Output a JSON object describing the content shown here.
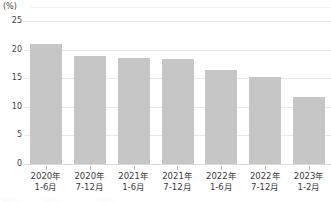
{
  "chart_data": {
    "type": "bar",
    "title": "",
    "subtitle": "",
    "xlabel": "",
    "ylabel": "(%)",
    "unit_label": "(%)",
    "ylim": [
      0,
      25
    ],
    "ytick_values": [
      0,
      5,
      10,
      15,
      20,
      25
    ],
    "ytick_labels": [
      "0",
      "5",
      "10",
      "15",
      "20",
      "25"
    ],
    "grid": true,
    "grid_orientation": "horizontal",
    "legend": false,
    "legend_position": "none",
    "bar_color": "#c6c6c6",
    "grid_color": "#e9e9e9",
    "axis_color": "#dcdcdc",
    "categories": [
      "2020年 1-6月",
      "2020年 7-12月",
      "2021年 1-6月",
      "2021年 7-12月",
      "2022年 1-6月",
      "2022年 7-12月",
      "2023年 1-2月"
    ],
    "category_lines": [
      {
        "line1": "2020年",
        "line2": "1-6月"
      },
      {
        "line1": "2020年",
        "line2": "7-12月"
      },
      {
        "line1": "2021年",
        "line2": "1-6月"
      },
      {
        "line1": "2021年",
        "line2": "7-12月"
      },
      {
        "line1": "2022年",
        "line2": "1-6月"
      },
      {
        "line1": "2022年",
        "line2": "7-12月"
      },
      {
        "line1": "2023年",
        "line2": "1-2月"
      }
    ],
    "values": [
      20.9,
      18.9,
      18.6,
      18.3,
      16.4,
      15.2,
      11.7
    ],
    "series": [
      {
        "name": "",
        "values": [
          20.9,
          18.9,
          18.6,
          18.3,
          16.4,
          15.2,
          11.7
        ]
      }
    ]
  }
}
